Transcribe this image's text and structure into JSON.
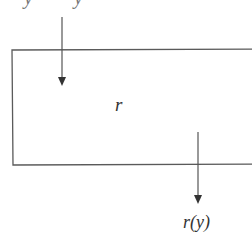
{
  "diagram": {
    "top_labels": [
      "y",
      "y"
    ],
    "block": {
      "label": "r"
    },
    "input_arrow": {
      "direction": "down"
    },
    "output_arrow": {
      "direction": "down"
    },
    "output_label": "r(y)",
    "colors": {
      "line": "#555555",
      "background": "#ffffff",
      "text": "#333333"
    }
  }
}
